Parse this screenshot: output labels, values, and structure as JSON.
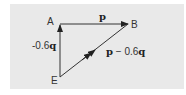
{
  "diagram": {
    "type": "vector-triangle",
    "background": "#e9e9e9",
    "line_color": "#333333",
    "points": {
      "A": {
        "label": "A",
        "x": 60,
        "y": 24
      },
      "B": {
        "label": "B",
        "x": 128,
        "y": 24
      },
      "E": {
        "label": "E",
        "x": 60,
        "y": 77
      }
    },
    "edges": [
      {
        "from": "A",
        "to": "B",
        "label": "p",
        "arrow": "end"
      },
      {
        "from": "E",
        "to": "A",
        "label": "-0.6q",
        "arrow": "end"
      },
      {
        "from": "E",
        "to": "B",
        "label": "p − 0.6q",
        "arrow": "middle"
      }
    ],
    "labels": {
      "A": "A",
      "B": "B",
      "E": "E",
      "AB_vector": "p",
      "EA_prefix": "-0.6",
      "EA_vector": "q",
      "EB_vector_p": "p",
      "EB_minus": " − 0.6",
      "EB_vector_q": "q"
    }
  }
}
